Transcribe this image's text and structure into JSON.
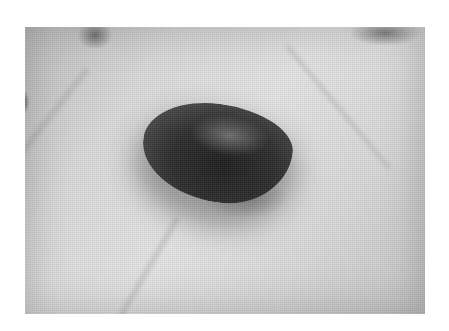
{
  "image": {
    "subject": "dark pebble resting on an open palm",
    "style": "grayscale photograph",
    "colors": {
      "background": "#ffffff",
      "skin_light": "#e4e4e4",
      "skin_mid": "#c4c4c4",
      "pebble_dark": "#1e1e1e",
      "pebble_edge": "#6a6a6a"
    }
  }
}
